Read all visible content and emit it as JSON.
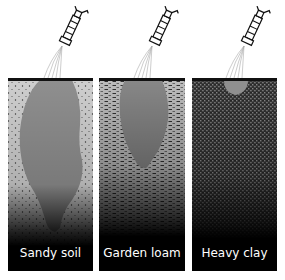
{
  "figure": {
    "panels": [
      {
        "id": "sandy-soil",
        "label": "Sandy soil",
        "texture": "sparse-dots",
        "water_plume": "deep-narrow"
      },
      {
        "id": "garden-loam",
        "label": "Garden loam",
        "texture": "dashes",
        "water_plume": "medium-teardrop"
      },
      {
        "id": "heavy-clay",
        "label": "Heavy clay",
        "texture": "dense-speckle",
        "water_plume": "shallow-wide"
      }
    ],
    "icons": {
      "nozzle": "spray-nozzle-icon",
      "spray": "water-spray-lines"
    },
    "colors": {
      "surface_line": "#111111",
      "water": "#8f8f8f",
      "soil_light": "#c9c9c9",
      "soil_dark": "#050505",
      "label_text": "#ffffff"
    }
  }
}
